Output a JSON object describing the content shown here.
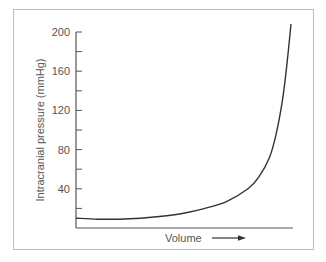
{
  "chart_data": {
    "type": "line",
    "title": "",
    "xlabel": "Volume",
    "ylabel": "Intracranial pressure (mmHg)",
    "ylim": [
      0,
      200
    ],
    "yticks_major": [
      40,
      80,
      120,
      160,
      200
    ],
    "yticks_minor": [
      20,
      60,
      100,
      140,
      180
    ],
    "x_ticks": [],
    "grid": false,
    "legend": null,
    "series": [
      {
        "name": "Pressure-volume curve",
        "x": [
          0,
          0.1,
          0.2,
          0.3,
          0.4,
          0.5,
          0.6,
          0.7,
          0.8,
          0.85,
          0.9,
          0.93,
          0.96,
          0.98,
          1.0
        ],
        "values": [
          10,
          9,
          9,
          10,
          12,
          15,
          20,
          27,
          40,
          52,
          72,
          95,
          130,
          165,
          208
        ]
      }
    ],
    "annotations": [
      "Volume arrow →"
    ]
  },
  "axes": {
    "y_tick_labels": [
      "200",
      "160",
      "120",
      "80",
      "40"
    ],
    "x_label": "Volume",
    "y_label": "Intracranial pressure (mmHg)"
  }
}
